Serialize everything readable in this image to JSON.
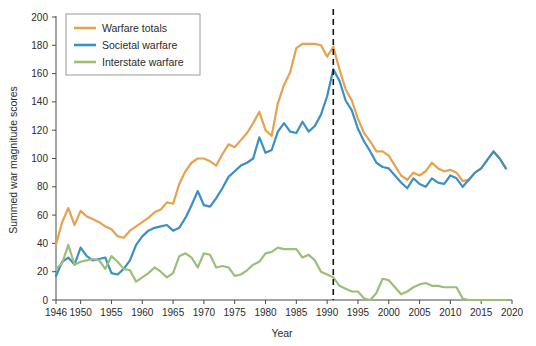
{
  "chart_data": {
    "type": "line",
    "title": "",
    "xlabel": "Year",
    "ylabel": "Summed war magnitude scores",
    "xlim": [
      1946,
      2020
    ],
    "ylim": [
      0,
      200
    ],
    "xticks": [
      1946,
      1950,
      1955,
      1960,
      1965,
      1970,
      1975,
      1980,
      1985,
      1990,
      1995,
      2000,
      2005,
      2010,
      2015,
      2020
    ],
    "yticks": [
      0,
      20,
      40,
      60,
      80,
      100,
      120,
      140,
      160,
      180,
      200
    ],
    "grid": false,
    "legend_position": "top-left",
    "annotations": [
      {
        "type": "vline",
        "x": 1991,
        "style": "dashed",
        "color": "#111111",
        "label": ""
      }
    ],
    "x": [
      1946,
      1947,
      1948,
      1949,
      1950,
      1951,
      1952,
      1953,
      1954,
      1955,
      1956,
      1957,
      1958,
      1959,
      1960,
      1961,
      1962,
      1963,
      1964,
      1965,
      1966,
      1967,
      1968,
      1969,
      1970,
      1971,
      1972,
      1973,
      1974,
      1975,
      1976,
      1977,
      1978,
      1979,
      1980,
      1981,
      1982,
      1983,
      1984,
      1985,
      1986,
      1987,
      1988,
      1989,
      1990,
      1991,
      1992,
      1993,
      1994,
      1995,
      1996,
      1997,
      1998,
      1999,
      2000,
      2001,
      2002,
      2003,
      2004,
      2005,
      2006,
      2007,
      2008,
      2009,
      2010,
      2011,
      2012,
      2013,
      2014,
      2015,
      2016,
      2017,
      2018,
      2019
    ],
    "series": [
      {
        "name": "Warfare totals",
        "color": "#E8A14E",
        "values": [
          39,
          55,
          65,
          53,
          63,
          59,
          57,
          55,
          52,
          50,
          45,
          44,
          49,
          52,
          55,
          58,
          62,
          64,
          69,
          68,
          82,
          91,
          97,
          100,
          100,
          98,
          95,
          103,
          110,
          108,
          113,
          118,
          125,
          133,
          120,
          116,
          139,
          152,
          161,
          178,
          181,
          181,
          181,
          180,
          172,
          179,
          163,
          149,
          141,
          128,
          118,
          112,
          105,
          105,
          102,
          95,
          88,
          85,
          90,
          88,
          91,
          97,
          93,
          91,
          92,
          90,
          84,
          85,
          90,
          93,
          99,
          105,
          100,
          93
        ]
      },
      {
        "name": "Societal warfare",
        "color": "#3C8FC4",
        "values": [
          17,
          27,
          30,
          25,
          37,
          31,
          28,
          29,
          30,
          19,
          18,
          22,
          28,
          39,
          45,
          49,
          51,
          52,
          53,
          49,
          51,
          58,
          67,
          77,
          67,
          66,
          72,
          79,
          87,
          91,
          95,
          97,
          100,
          115,
          104,
          106,
          119,
          125,
          119,
          118,
          126,
          119,
          123,
          131,
          144,
          163,
          155,
          141,
          134,
          121,
          112,
          105,
          97,
          94,
          93,
          88,
          83,
          79,
          86,
          82,
          80,
          86,
          83,
          82,
          88,
          86,
          80,
          85,
          90,
          93,
          99,
          105,
          100,
          93
        ]
      },
      {
        "name": "Interstate warfare",
        "color": "#9DBE78",
        "values": [
          22,
          26,
          39,
          25,
          27,
          28,
          29,
          28,
          22,
          31,
          27,
          22,
          21,
          13,
          16,
          19,
          23,
          20,
          16,
          19,
          31,
          33,
          30,
          23,
          33,
          32,
          23,
          24,
          23,
          17,
          18,
          21,
          25,
          27,
          33,
          34,
          37,
          36,
          36,
          36,
          30,
          32,
          28,
          20,
          18,
          16,
          10,
          8,
          6,
          6,
          1,
          0,
          5,
          15,
          14,
          9,
          4,
          6,
          9,
          11,
          12,
          10,
          10,
          9,
          9,
          9,
          1,
          0,
          0,
          0,
          0,
          0,
          0,
          0
        ]
      }
    ]
  },
  "legend": {
    "items": [
      {
        "label": "Warfare totals",
        "color": "#E8A14E"
      },
      {
        "label": "Societal warfare",
        "color": "#3C8FC4"
      },
      {
        "label": "Interstate warfare",
        "color": "#9DBE78"
      }
    ]
  }
}
